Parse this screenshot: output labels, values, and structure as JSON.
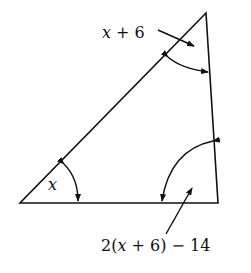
{
  "diagram": {
    "type": "triangle-angle-problem",
    "vertices": {
      "top": [
        206,
        13
      ],
      "bottom_left": [
        20,
        203
      ],
      "bottom_right": [
        218,
        203
      ]
    },
    "angles": [
      {
        "vertex": "top",
        "label": "x + 6",
        "label_parts": [
          "x",
          " + 6"
        ]
      },
      {
        "vertex": "bottom_left",
        "label": "x"
      },
      {
        "vertex": "bottom_right",
        "label": "2(x + 6) − 14",
        "label_parts": [
          "2(",
          "x",
          " + 6) − 14"
        ]
      }
    ],
    "stroke_color": "#111111",
    "background_color": "#ffffff"
  },
  "labels": {
    "top_angle_var": "x",
    "top_angle_rest": " + 6",
    "left_angle": "x",
    "right_angle_pre": "2(",
    "right_angle_var": "x",
    "right_angle_rest": " + 6) − 14"
  }
}
